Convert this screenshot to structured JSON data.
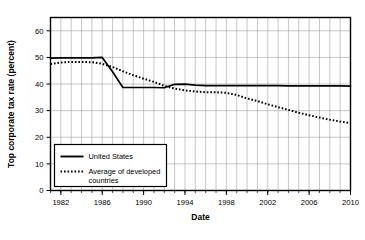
{
  "chart_data": {
    "type": "line",
    "title": "",
    "xlabel": "Date",
    "ylabel": "Top corporate tax rate (percent)",
    "xlim": [
      1981,
      2010
    ],
    "ylim": [
      0,
      65
    ],
    "grid": true,
    "legend_position": "lower-left",
    "y_ticks": [
      0,
      10,
      20,
      30,
      40,
      50,
      60
    ],
    "y_tick_labels": [
      "0",
      "10",
      "20",
      "30",
      "40",
      "50",
      "60"
    ],
    "x_ticks": [
      1982,
      1986,
      1990,
      1994,
      1998,
      2002,
      2006,
      2010
    ],
    "x_tick_labels": [
      "1982",
      "1986",
      "1990",
      "1994",
      "1998",
      "2002",
      "2006",
      "2010"
    ],
    "x_minor_tick_interval": 1,
    "x": [
      1981,
      1982,
      1983,
      1984,
      1985,
      1986,
      1987,
      1988,
      1989,
      1990,
      1991,
      1992,
      1993,
      1994,
      1995,
      1996,
      1997,
      1998,
      1999,
      2000,
      2001,
      2002,
      2003,
      2004,
      2005,
      2006,
      2007,
      2008,
      2009,
      2010
    ],
    "series": [
      {
        "name": "United States",
        "style": "solid",
        "color": "#000000",
        "values": [
          49.7,
          49.8,
          49.8,
          49.8,
          49.8,
          50.0,
          44.6,
          38.7,
          38.7,
          38.7,
          38.7,
          38.6,
          39.9,
          40.0,
          39.6,
          39.4,
          39.4,
          39.4,
          39.4,
          39.4,
          39.4,
          39.4,
          39.4,
          39.3,
          39.3,
          39.3,
          39.3,
          39.3,
          39.3,
          39.2
        ]
      },
      {
        "name": "Average of developed countries",
        "style": "dotted",
        "color": "#000000",
        "values": [
          47.5,
          48.1,
          48.3,
          48.3,
          48.2,
          47.6,
          46.4,
          44.8,
          43.3,
          42.0,
          40.8,
          39.3,
          38.3,
          37.6,
          37.2,
          36.9,
          36.9,
          36.7,
          35.9,
          34.6,
          33.6,
          32.4,
          31.3,
          30.3,
          29.2,
          28.3,
          27.4,
          26.6,
          25.9,
          25.3
        ]
      }
    ]
  }
}
